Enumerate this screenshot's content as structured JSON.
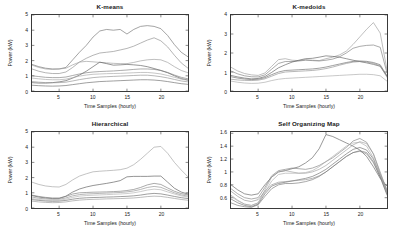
{
  "figure": {
    "xlabel": "Time Samples (hourly)",
    "ylabel": "Power (kW)",
    "axis_color": "#3a3a3a"
  },
  "chart_data": [
    {
      "type": "line",
      "title": "K-means",
      "xlabel": "Time Samples (hourly)",
      "ylabel": "Power (kW)",
      "xlim": [
        1,
        24
      ],
      "ylim": [
        0,
        5
      ],
      "xticks": [
        5,
        10,
        15,
        20
      ],
      "yticks": [
        0,
        1,
        2,
        3,
        4,
        5
      ],
      "grid": false,
      "legend": "none",
      "x": [
        1,
        2,
        3,
        4,
        5,
        6,
        7,
        8,
        9,
        10,
        11,
        12,
        13,
        14,
        15,
        16,
        17,
        18,
        19,
        20,
        21,
        22,
        23,
        24
      ],
      "series": [
        {
          "name": "cluster-1",
          "color": "#6f6f6f",
          "values": [
            1.75,
            1.6,
            1.5,
            1.45,
            1.45,
            1.55,
            2.05,
            2.55,
            3.0,
            3.55,
            3.95,
            4.05,
            4.0,
            4.05,
            3.75,
            4.05,
            4.25,
            4.3,
            4.25,
            4.1,
            3.65,
            3.05,
            2.55,
            2.25
          ]
        },
        {
          "name": "cluster-2",
          "color": "#8a8a8a",
          "values": [
            1.45,
            1.3,
            1.2,
            1.15,
            1.15,
            1.25,
            1.55,
            1.9,
            2.15,
            2.35,
            2.5,
            2.55,
            2.6,
            2.7,
            2.8,
            2.95,
            3.15,
            3.35,
            3.5,
            3.3,
            2.9,
            2.35,
            1.85,
            1.5
          ]
        },
        {
          "name": "cluster-3",
          "color": "#9a9a9a",
          "values": [
            1.7,
            1.55,
            1.45,
            1.42,
            1.45,
            1.5,
            1.72,
            1.9,
            1.95,
            1.92,
            1.88,
            1.85,
            1.82,
            1.8,
            1.8,
            1.88,
            1.98,
            2.05,
            2.08,
            2.05,
            1.88,
            1.6,
            1.35,
            1.2
          ]
        },
        {
          "name": "cluster-4",
          "color": "#5a5a5a",
          "values": [
            0.55,
            0.52,
            0.52,
            0.55,
            0.6,
            0.68,
            0.85,
            1.05,
            1.3,
            1.6,
            1.9,
            1.8,
            1.7,
            1.72,
            1.75,
            1.72,
            1.68,
            1.6,
            1.48,
            1.35,
            1.2,
            1.0,
            0.82,
            0.72
          ]
        },
        {
          "name": "cluster-5",
          "color": "#7d7d7d",
          "values": [
            1.0,
            0.95,
            0.9,
            0.88,
            0.88,
            0.92,
            1.02,
            1.12,
            1.2,
            1.25,
            1.28,
            1.3,
            1.32,
            1.35,
            1.38,
            1.42,
            1.45,
            1.45,
            1.42,
            1.35,
            1.22,
            1.05,
            0.9,
            0.8
          ]
        },
        {
          "name": "cluster-6",
          "color": "#a5a5a5",
          "values": [
            0.85,
            0.8,
            0.76,
            0.74,
            0.74,
            0.78,
            0.88,
            0.98,
            1.05,
            1.1,
            1.12,
            1.14,
            1.15,
            1.16,
            1.18,
            1.2,
            1.22,
            1.22,
            1.18,
            1.12,
            1.02,
            0.9,
            0.78,
            0.7
          ]
        },
        {
          "name": "cluster-7",
          "color": "#6a6a6a",
          "values": [
            0.38,
            0.35,
            0.33,
            0.32,
            0.33,
            0.36,
            0.42,
            0.48,
            0.54,
            0.58,
            0.62,
            0.64,
            0.66,
            0.68,
            0.7,
            0.72,
            0.74,
            0.74,
            0.72,
            0.68,
            0.62,
            0.55,
            0.48,
            0.44
          ]
        },
        {
          "name": "cluster-8",
          "color": "#909090",
          "values": [
            0.62,
            0.58,
            0.55,
            0.54,
            0.55,
            0.58,
            0.66,
            0.75,
            0.82,
            0.88,
            0.92,
            0.94,
            0.96,
            0.98,
            1.0,
            1.02,
            1.04,
            1.04,
            1.0,
            0.94,
            0.86,
            0.76,
            0.66,
            0.6
          ]
        }
      ]
    },
    {
      "type": "line",
      "title": "K-medoids",
      "xlabel": "Time Samples (hourly)",
      "ylabel": "Power (kW)",
      "xlim": [
        1,
        24
      ],
      "ylim": [
        0,
        4
      ],
      "xticks": [
        5,
        10,
        15,
        20
      ],
      "yticks": [
        0,
        1,
        2,
        3,
        4
      ],
      "grid": false,
      "legend": "none",
      "x": [
        1,
        2,
        3,
        4,
        5,
        6,
        7,
        8,
        9,
        10,
        11,
        12,
        13,
        14,
        15,
        16,
        17,
        18,
        19,
        20,
        21,
        22,
        23,
        24
      ],
      "series": [
        {
          "name": "cluster-1",
          "color": "#9a9a9a",
          "values": [
            1.25,
            1.05,
            0.92,
            0.85,
            0.82,
            0.95,
            1.3,
            1.65,
            1.7,
            1.62,
            1.6,
            1.65,
            1.62,
            1.6,
            1.7,
            1.78,
            1.9,
            2.1,
            2.45,
            2.85,
            3.25,
            3.6,
            3.05,
            1.1
          ]
        },
        {
          "name": "cluster-2",
          "color": "#7a7a7a",
          "values": [
            1.05,
            0.9,
            0.8,
            0.75,
            0.74,
            0.85,
            1.15,
            1.45,
            1.55,
            1.55,
            1.58,
            1.62,
            1.6,
            1.58,
            1.62,
            1.68,
            1.8,
            2.0,
            2.25,
            2.35,
            2.4,
            2.42,
            2.3,
            0.95
          ]
        },
        {
          "name": "cluster-3",
          "color": "#5f5f5f",
          "values": [
            0.82,
            0.74,
            0.68,
            0.64,
            0.66,
            0.76,
            0.98,
            1.22,
            1.38,
            1.52,
            1.62,
            1.7,
            1.72,
            1.78,
            1.85,
            1.82,
            1.78,
            1.7,
            1.62,
            1.55,
            1.48,
            1.4,
            1.3,
            0.78
          ]
        },
        {
          "name": "cluster-4",
          "color": "#8d8d8d",
          "values": [
            0.62,
            0.58,
            0.56,
            0.55,
            0.57,
            0.64,
            0.78,
            0.92,
            1.0,
            1.02,
            1.04,
            1.06,
            1.08,
            1.12,
            1.18,
            1.26,
            1.36,
            1.45,
            1.52,
            1.55,
            1.52,
            1.45,
            1.32,
            0.72
          ]
        },
        {
          "name": "cluster-5",
          "color": "#6b6b6b",
          "values": [
            0.75,
            0.68,
            0.63,
            0.6,
            0.62,
            0.7,
            0.86,
            1.0,
            1.08,
            1.1,
            1.12,
            1.14,
            1.16,
            1.2,
            1.26,
            1.34,
            1.42,
            1.5,
            1.56,
            1.58,
            1.56,
            1.5,
            1.38,
            0.8
          ]
        },
        {
          "name": "cluster-6",
          "color": "#a8a8a8",
          "values": [
            0.52,
            0.46,
            0.42,
            0.4,
            0.41,
            0.46,
            0.55,
            0.62,
            0.66,
            0.68,
            0.7,
            0.72,
            0.74,
            0.76,
            0.78,
            0.8,
            0.82,
            0.84,
            0.86,
            0.88,
            0.88,
            0.86,
            0.8,
            0.52
          ]
        }
      ]
    },
    {
      "type": "line",
      "title": "Hierarchical",
      "xlabel": "Time Samples (hourly)",
      "ylabel": "Power (kW)",
      "xlim": [
        1,
        24
      ],
      "ylim": [
        0,
        5
      ],
      "xticks": [
        5,
        10,
        15,
        20
      ],
      "yticks": [
        0,
        1,
        2,
        3,
        4,
        5
      ],
      "grid": false,
      "legend": "none",
      "x": [
        1,
        2,
        3,
        4,
        5,
        6,
        7,
        8,
        9,
        10,
        11,
        12,
        13,
        14,
        15,
        16,
        17,
        18,
        19,
        20,
        21,
        22,
        23,
        24
      ],
      "series": [
        {
          "name": "cluster-1",
          "color": "#a0a0a0",
          "values": [
            1.7,
            1.55,
            1.45,
            1.4,
            1.38,
            1.55,
            1.85,
            2.1,
            2.25,
            2.38,
            2.42,
            2.45,
            2.48,
            2.52,
            2.62,
            2.85,
            3.2,
            3.6,
            4.0,
            4.05,
            3.6,
            3.0,
            2.5,
            2.05
          ]
        },
        {
          "name": "cluster-2",
          "color": "#585858",
          "values": [
            0.82,
            0.72,
            0.66,
            0.62,
            0.62,
            0.78,
            1.05,
            1.25,
            1.38,
            1.48,
            1.55,
            1.62,
            1.7,
            1.8,
            2.05,
            2.08,
            2.08,
            2.08,
            2.1,
            2.1,
            1.7,
            1.3,
            1.05,
            0.92
          ]
        },
        {
          "name": "cluster-3",
          "color": "#7a7a7a",
          "values": [
            0.85,
            0.76,
            0.7,
            0.66,
            0.66,
            0.76,
            0.92,
            1.0,
            1.02,
            1.04,
            1.05,
            1.06,
            1.08,
            1.1,
            1.15,
            1.22,
            1.35,
            1.52,
            1.62,
            1.55,
            1.32,
            1.1,
            0.95,
            0.86
          ]
        },
        {
          "name": "cluster-4",
          "color": "#8f8f8f",
          "values": [
            0.72,
            0.64,
            0.6,
            0.57,
            0.58,
            0.66,
            0.8,
            0.88,
            0.92,
            0.94,
            0.96,
            0.98,
            1.0,
            1.02,
            1.06,
            1.12,
            1.22,
            1.35,
            1.42,
            1.36,
            1.18,
            1.0,
            0.86,
            0.78
          ]
        },
        {
          "name": "cluster-5",
          "color": "#b0b0b0",
          "values": [
            0.62,
            0.56,
            0.52,
            0.5,
            0.51,
            0.58,
            0.7,
            0.78,
            0.82,
            0.84,
            0.86,
            0.88,
            0.9,
            0.92,
            0.95,
            1.0,
            1.08,
            1.18,
            1.24,
            1.2,
            1.06,
            0.92,
            0.8,
            0.72
          ]
        },
        {
          "name": "cluster-6",
          "color": "#6a6a6a",
          "values": [
            0.55,
            0.5,
            0.46,
            0.44,
            0.45,
            0.5,
            0.58,
            0.64,
            0.67,
            0.69,
            0.7,
            0.72,
            0.73,
            0.75,
            0.77,
            0.8,
            0.85,
            0.92,
            0.96,
            0.93,
            0.85,
            0.76,
            0.68,
            0.62
          ]
        },
        {
          "name": "cluster-7",
          "color": "#979797",
          "values": [
            0.45,
            0.4,
            0.37,
            0.35,
            0.36,
            0.4,
            0.47,
            0.52,
            0.55,
            0.57,
            0.58,
            0.6,
            0.61,
            0.62,
            0.64,
            0.66,
            0.7,
            0.75,
            0.78,
            0.76,
            0.7,
            0.63,
            0.56,
            0.51
          ]
        }
      ]
    },
    {
      "type": "line",
      "title": "Self Organizing Map",
      "xlabel": "Time Samples (hourly)",
      "ylabel": "Power (kW)",
      "xlim": [
        1,
        24
      ],
      "ylim": [
        0.44,
        1.62
      ],
      "xticks": [
        5,
        10,
        15,
        20
      ],
      "yticks": [
        0.6,
        0.8,
        1,
        1.2,
        1.4,
        1.6
      ],
      "grid": false,
      "legend": "none",
      "x": [
        1,
        2,
        3,
        4,
        5,
        6,
        7,
        8,
        9,
        10,
        11,
        12,
        13,
        14,
        15,
        16,
        17,
        18,
        19,
        20,
        21,
        22,
        23,
        24
      ],
      "series": [
        {
          "name": "cluster-1",
          "color": "#5e5e5e",
          "values": [
            0.8,
            0.72,
            0.66,
            0.64,
            0.66,
            0.8,
            0.92,
            1.0,
            1.02,
            1.05,
            1.08,
            1.14,
            1.22,
            1.36,
            1.58,
            1.55,
            1.5,
            1.45,
            1.4,
            1.34,
            1.24,
            1.08,
            0.9,
            0.78
          ]
        },
        {
          "name": "cluster-2",
          "color": "#7f7f7f",
          "values": [
            0.74,
            0.66,
            0.6,
            0.58,
            0.6,
            0.76,
            0.94,
            1.02,
            1.04,
            1.06,
            1.05,
            1.04,
            1.06,
            1.1,
            1.16,
            1.22,
            1.3,
            1.38,
            1.48,
            1.52,
            1.46,
            1.28,
            0.98,
            0.72
          ]
        },
        {
          "name": "cluster-3",
          "color": "#9d9d9d",
          "values": [
            0.64,
            0.56,
            0.5,
            0.48,
            0.52,
            0.72,
            0.92,
            1.0,
            1.02,
            1.0,
            0.98,
            0.98,
            1.0,
            1.04,
            1.1,
            1.18,
            1.26,
            1.34,
            1.42,
            1.47,
            1.44,
            1.28,
            1.0,
            0.7
          ]
        },
        {
          "name": "cluster-4",
          "color": "#6d6d6d",
          "values": [
            0.58,
            0.52,
            0.48,
            0.46,
            0.5,
            0.66,
            0.78,
            0.82,
            0.84,
            0.86,
            0.88,
            0.9,
            0.93,
            0.98,
            1.04,
            1.12,
            1.2,
            1.28,
            1.35,
            1.38,
            1.34,
            1.2,
            0.95,
            0.68
          ]
        },
        {
          "name": "cluster-5",
          "color": "#8c8c8c",
          "values": [
            0.7,
            0.62,
            0.56,
            0.54,
            0.57,
            0.7,
            0.8,
            0.84,
            0.85,
            0.86,
            0.87,
            0.88,
            0.9,
            0.94,
            1.0,
            1.08,
            1.16,
            1.24,
            1.3,
            1.32,
            1.28,
            1.14,
            0.92,
            0.66
          ]
        },
        {
          "name": "cluster-6",
          "color": "#ababab",
          "values": [
            0.62,
            0.55,
            0.5,
            0.48,
            0.52,
            0.68,
            0.86,
            0.96,
            0.98,
            0.98,
            0.98,
            0.99,
            1.02,
            1.08,
            1.16,
            1.24,
            1.32,
            1.4,
            1.45,
            1.46,
            1.4,
            1.22,
            0.96,
            0.66
          ]
        },
        {
          "name": "cluster-7",
          "color": "#747474",
          "values": [
            0.52,
            0.48,
            0.46,
            0.45,
            0.49,
            0.62,
            0.74,
            0.8,
            0.82,
            0.82,
            0.83,
            0.85,
            0.88,
            0.93,
            1.0,
            1.08,
            1.16,
            1.24,
            1.3,
            1.33,
            1.3,
            1.16,
            0.92,
            0.64
          ]
        }
      ]
    }
  ]
}
